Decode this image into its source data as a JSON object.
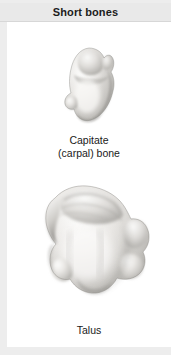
{
  "panel": {
    "title": "Short bones",
    "background_color": "#ffffff",
    "title_band_color": "#e9e9e9",
    "title_text_color": "#1c1c1c"
  },
  "specimens": [
    {
      "id": "capitate",
      "image_name": "capitate-bone-illustration",
      "caption_line_1": "Capitate",
      "caption_line_2": "(carpal) bone",
      "bone_color_light": "#f2f1ef",
      "bone_color_mid": "#c9c7c3",
      "bone_color_shadow": "#8e8c88"
    },
    {
      "id": "talus",
      "image_name": "talus-bone-illustration",
      "caption_line_1": "Talus",
      "caption_line_2": "",
      "bone_color_light": "#f4f3f1",
      "bone_color_mid": "#c4c2be",
      "bone_color_shadow": "#817f7b"
    }
  ]
}
